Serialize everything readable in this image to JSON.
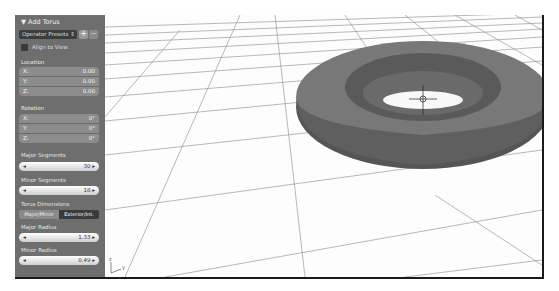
{
  "panel": {
    "title": "▼ Add Torus",
    "presets_label": "Operator Presets",
    "presets_arrow": "⇕",
    "add_preset": "+",
    "remove_preset": "−",
    "align_to_view": "Align to View",
    "location": {
      "label": "Location",
      "rows": [
        {
          "axis": "X:",
          "value": "0.00"
        },
        {
          "axis": "Y:",
          "value": "0.00"
        },
        {
          "axis": "Z:",
          "value": "0.00"
        }
      ]
    },
    "rotation": {
      "label": "Rotation",
      "rows": [
        {
          "axis": "X:",
          "value": "0°"
        },
        {
          "axis": "Y:",
          "value": "0°"
        },
        {
          "axis": "Z:",
          "value": "0°"
        }
      ]
    },
    "major_segments": {
      "label": "Major Segments",
      "value": "30"
    },
    "minor_segments": {
      "label": "Minor Segments",
      "value": "18"
    },
    "torus_dimensions": {
      "label": "Torus Dimensions",
      "options": [
        "Major/Minor",
        "Exterior/Int."
      ],
      "selected": "Exterior/Int."
    },
    "major_radius": {
      "label": "Major Radius",
      "value": "1.33"
    },
    "minor_radius": {
      "label": "Minor Radius",
      "value": "0.49"
    }
  },
  "viewport": {
    "axis_labels": {
      "z": "z",
      "y": "y"
    }
  }
}
